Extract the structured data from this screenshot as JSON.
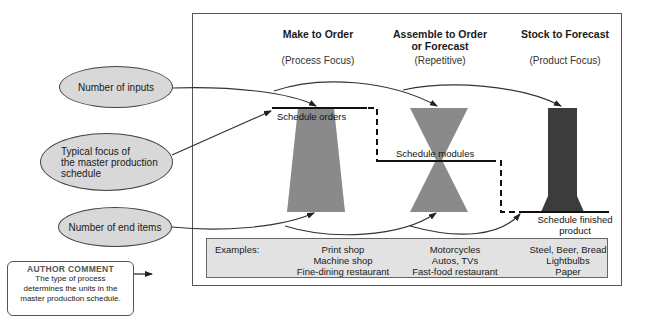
{
  "columns": [
    {
      "title": "Make to Order",
      "subtitle": "(Process Focus)"
    },
    {
      "title": "Assemble to Order or Forecast",
      "title_line1": "Assemble to Order",
      "title_line2": "or Forecast",
      "subtitle": "(Repetitive)"
    },
    {
      "title": "Stock to Forecast",
      "subtitle": "(Product Focus)"
    }
  ],
  "ovals": {
    "inputs": "Number of inputs",
    "focus_line1": "Typical focus of",
    "focus_line2": "the master production",
    "focus_line3": "schedule",
    "end_items": "Number of end items"
  },
  "schedule_labels": {
    "orders": "Schedule orders",
    "modules": "Schedule modules",
    "finished_line1": "Schedule finished",
    "finished_line2": "product"
  },
  "examples": {
    "label": "Examples:",
    "make_to_order": [
      "Print shop",
      "Machine shop",
      "Fine-dining restaurant"
    ],
    "assemble_to_order": [
      "Motorcycles",
      "Autos, TVs",
      "Fast-food restaurant"
    ],
    "stock_to_forecast": [
      "Steel, Beer, Bread",
      "Lightbulbs",
      "Paper"
    ]
  },
  "author_comment": {
    "title": "AUTHOR COMMENT",
    "line1": "The type of process",
    "line2": "determines the units in the",
    "line3": "master production schedule."
  },
  "colors": {
    "oval_fill": "#d8d8d8",
    "make_to_order_shape": "#8a8a8a",
    "assemble_shape": "#8a8a8a",
    "stock_shape": "#3c3c3c",
    "examples_fill": "#e2e2e2"
  }
}
